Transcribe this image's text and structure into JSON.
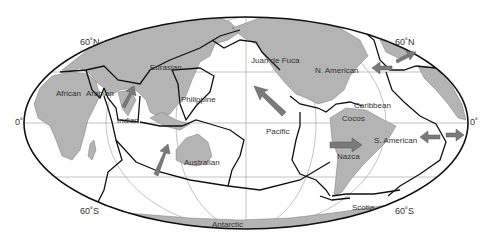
{
  "diagram": {
    "type": "tectonic-plate-map",
    "projection": "mollweide-ellipse",
    "colors": {
      "land": "#b4b4b4",
      "ocean": "#ffffff",
      "plate_boundary": "#111111",
      "graticule": "#9a9a9a",
      "arrow": "#7a7a7a"
    },
    "latitude_labels": {
      "n60_left": "60˚N",
      "n60_right": "60˚N",
      "eq_left": "0˚",
      "eq_right": "0˚",
      "s60_left": "60˚S",
      "s60_right": "60˚S"
    },
    "plates": [
      {
        "name": "African"
      },
      {
        "name": "Arabian"
      },
      {
        "name": "Eurasian"
      },
      {
        "name": "Indian"
      },
      {
        "name": "Philippine"
      },
      {
        "name": "Australian"
      },
      {
        "name": "Juan de Fuca"
      },
      {
        "name": "Pacific"
      },
      {
        "name": "N. American"
      },
      {
        "name": "Caribbean"
      },
      {
        "name": "Cocos"
      },
      {
        "name": "Nazca"
      },
      {
        "name": "S. American"
      },
      {
        "name": "Scotia"
      },
      {
        "name": "Antarctic"
      }
    ],
    "arrows": [
      {
        "label": "indian-motion",
        "direction": "northeast"
      },
      {
        "label": "australian-motion",
        "direction": "northeast"
      },
      {
        "label": "pacific-motion",
        "direction": "northwest"
      },
      {
        "label": "nazca-motion",
        "direction": "east"
      },
      {
        "label": "north-american-motion",
        "direction": "west"
      },
      {
        "label": "eurasian-motion",
        "direction": "east"
      },
      {
        "label": "south-american-motion",
        "direction": "west"
      },
      {
        "label": "african-motion",
        "direction": "east"
      }
    ]
  }
}
